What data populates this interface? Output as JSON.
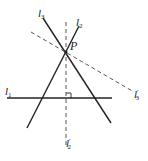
{
  "diagram": {
    "colors": {
      "line": "#222222",
      "dashed": "#555555",
      "background": "#ffffff"
    },
    "point": {
      "name": "P",
      "x": 66,
      "y": 52
    },
    "lines": [
      {
        "id": "l1",
        "label": "l",
        "sub": "1",
        "style": "solid"
      },
      {
        "id": "l2",
        "label": "l",
        "sub": "2",
        "style": "solid"
      },
      {
        "id": "l3",
        "label": "l",
        "sub": "3",
        "style": "solid"
      },
      {
        "id": "l2prime",
        "label": "l",
        "sub": "2",
        "prime": "′",
        "style": "dashed"
      },
      {
        "id": "l3prime",
        "label": "l",
        "sub": "3",
        "prime": "′",
        "style": "dashed"
      }
    ],
    "annotations": {
      "right_angle": "l1 ⟂ l2′"
    }
  }
}
